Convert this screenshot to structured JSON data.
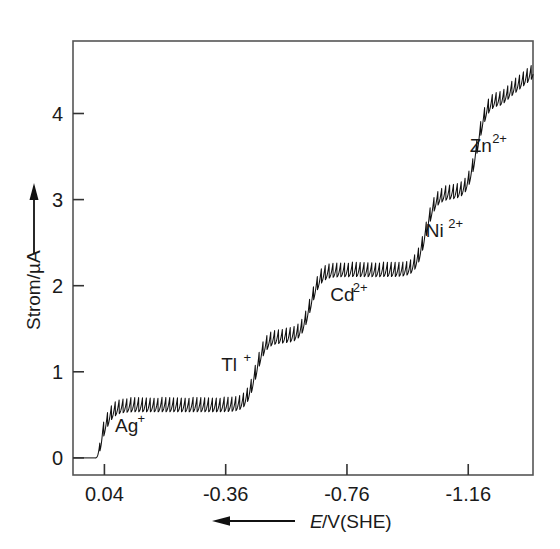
{
  "chart_data": {
    "type": "line",
    "title": "",
    "subtitle": "",
    "xlabel": "E/V(SHE)",
    "xlabel_italic_part": "E",
    "xlabel_rest": "/V(SHE)",
    "ylabel": "Strom/µA",
    "x_axis_direction_arrow": "left",
    "y_axis_direction_arrow": "up",
    "xlim": [
      0.1436,
      -1.3736
    ],
    "ylim": [
      -0.1988,
      4.8421
    ],
    "x_ticks": [
      0.04,
      -0.36,
      -0.76,
      -1.16
    ],
    "x_tick_labels": [
      "0.04",
      "-0.36",
      "-0.76",
      "-1.16"
    ],
    "y_ticks": [
      0,
      1,
      2,
      3,
      4
    ],
    "y_tick_labels": [
      "0",
      "1",
      "2",
      "3",
      "4"
    ],
    "grid": false,
    "legend_position": "none",
    "line_color": "#111111",
    "frame_color": "#555555",
    "oscillation": {
      "description": "dropping-mercury-electrode current oscillations (sawtooth)",
      "drops_per_volt": 78,
      "amplitude_uA": 0.085
    },
    "annotations": [
      {
        "label": "Ag",
        "charge": "+",
        "x": 0.005,
        "y": 0.3
      },
      {
        "label": "Tl",
        "charge": "+",
        "x": -0.345,
        "y": 1.01
      },
      {
        "label": "Cd",
        "charge": "2+",
        "x": -0.705,
        "y": 1.82
      },
      {
        "label": "Ni",
        "charge": "2+",
        "x": -1.02,
        "y": 2.56
      },
      {
        "label": "Zn",
        "charge": "2+",
        "x": -1.165,
        "y": 3.55
      }
    ],
    "waves": [
      {
        "ion": "Ag+",
        "half_wave_potential": 0.045,
        "plateau_current": 0.62,
        "limiting_current": 0.62
      },
      {
        "ion": "Tl+",
        "half_wave_potential": -0.46,
        "plateau_current": 1.55,
        "limiting_current": 0.8
      },
      {
        "ion": "Cd2+",
        "half_wave_potential": -0.64,
        "plateau_current": 2.32,
        "limiting_current": 0.77
      },
      {
        "ion": "Ni2+",
        "half_wave_potential": -1.02,
        "plateau_current": 3.22,
        "limiting_current": 0.9
      },
      {
        "ion": "Zn2+",
        "half_wave_potential": -1.19,
        "plateau_current": 4.32,
        "limiting_current": 1.1
      }
    ],
    "baseline_current": 0.0,
    "residual_start_potential": 0.068,
    "final_rise_current": 4.75,
    "curve_points_note": "Step (wave) shaped polarogram; each plateau is a diffusion limiting current."
  }
}
